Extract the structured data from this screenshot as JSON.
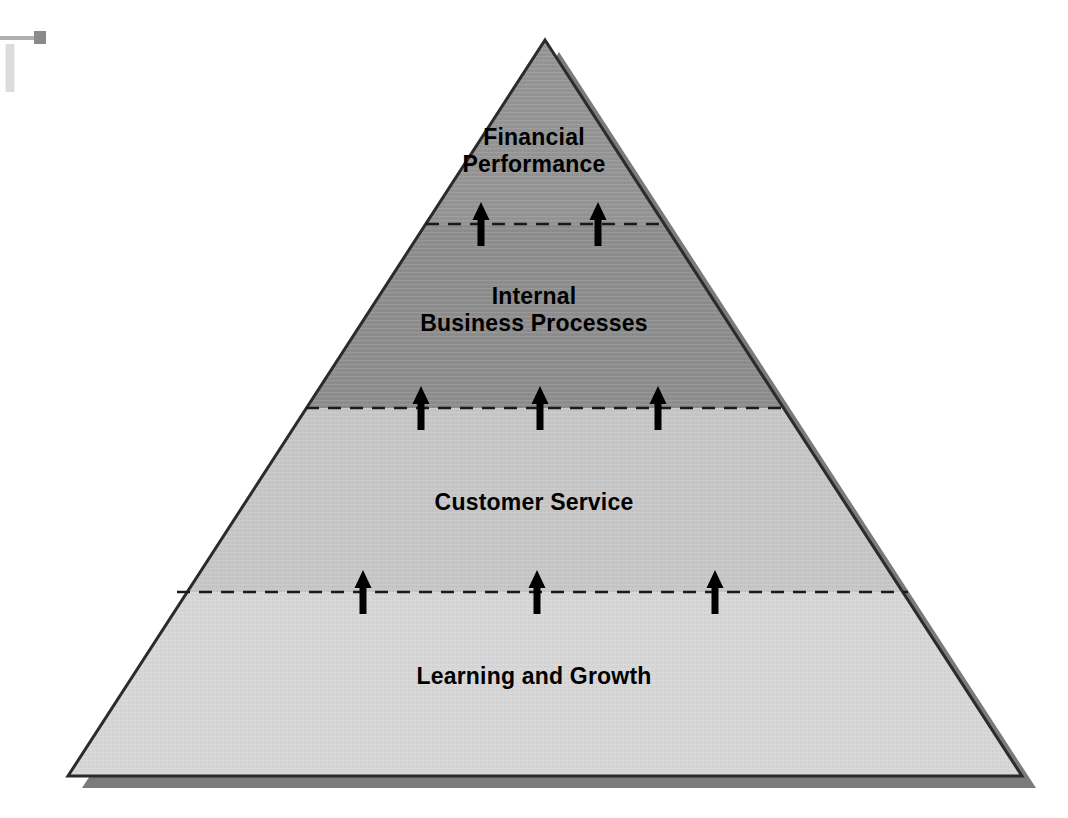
{
  "document": {
    "type": "balanced-scorecard-pyramid",
    "background_color": "#ffffff",
    "canvas": {
      "width": 1068,
      "height": 818
    }
  },
  "pyramid": {
    "apex": {
      "x": 545,
      "y": 40
    },
    "base_left": {
      "x": 68,
      "y": 776
    },
    "base_right": {
      "x": 1022,
      "y": 776
    },
    "outline_color": "#2b2b2b",
    "shadow_color": "#7b7b7b",
    "shadow_offset": {
      "x": 14,
      "y": 12
    },
    "levels": [
      {
        "id": "level-1",
        "order": 1,
        "label": "Financial\nPerformance",
        "label_lines": [
          "Financial",
          "Performance"
        ],
        "fill_color": "#949494",
        "top_y": 40,
        "bottom_y": 224
      },
      {
        "id": "level-2",
        "order": 2,
        "label": "Internal\nBusiness Processes",
        "label_lines": [
          "Internal",
          "Business Processes"
        ],
        "fill_color": "#8d8d8d",
        "top_y": 224,
        "bottom_y": 408
      },
      {
        "id": "level-3",
        "order": 3,
        "label": "Customer Service",
        "label_lines": [
          "Customer Service"
        ],
        "fill_color": "#c6c6c6",
        "top_y": 408,
        "bottom_y": 592
      },
      {
        "id": "level-4",
        "order": 4,
        "label": "Learning and Growth",
        "label_lines": [
          "Learning and Growth"
        ],
        "fill_color": "#d6d6d6",
        "top_y": 592,
        "bottom_y": 776
      }
    ],
    "dividers": [
      {
        "id": "divider-1",
        "y": 224,
        "x_start": 426,
        "x_end": 664,
        "style": "dashed",
        "color": "#1a1a1a",
        "arrow_count": 2,
        "arrow_x": [
          481,
          598
        ]
      },
      {
        "id": "divider-2",
        "y": 408,
        "x_start": 306,
        "x_end": 786,
        "style": "dashed",
        "color": "#1a1a1a",
        "arrow_count": 3,
        "arrow_x": [
          421,
          540,
          658
        ]
      },
      {
        "id": "divider-3",
        "y": 592,
        "x_start": 177,
        "x_end": 908,
        "style": "dashed",
        "color": "#1a1a1a",
        "arrow_count": 3,
        "arrow_x": [
          363,
          537,
          715
        ]
      }
    ],
    "arrow": {
      "direction": "up",
      "color": "#000000",
      "height": 44,
      "head_width": 17,
      "shaft_width": 7
    }
  },
  "artifact": {
    "name": "scan-edge-mark",
    "line_color": "#b0b0b0",
    "handle_color": "#8a8a8a",
    "line": {
      "x1": 0,
      "y1": 38,
      "x2": 36,
      "y2": 38
    },
    "handle": {
      "x": 34,
      "y": 31,
      "w": 12,
      "h": 13
    },
    "vertical": {
      "x1": 10,
      "y1": 44,
      "x2": 10,
      "y2": 92
    }
  }
}
